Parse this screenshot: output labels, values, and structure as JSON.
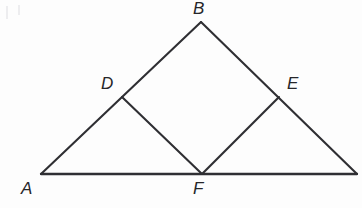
{
  "figure": {
    "background_color": "#fdfdfd",
    "stroke_color": "#2f2f33",
    "label_color": "#262629",
    "width": 362,
    "height": 208,
    "points": {
      "A": {
        "label": "A",
        "x": 41,
        "y": 174,
        "label_x": 21,
        "label_y": 180
      },
      "B": {
        "label": "B",
        "x": 201,
        "y": 22,
        "label_x": 193,
        "label_y": 0
      },
      "C": {
        "label": "",
        "x": 357,
        "y": 174,
        "label_x": 0,
        "label_y": 0
      },
      "D": {
        "label": "D",
        "x": 122,
        "y": 97,
        "label_x": 101,
        "label_y": 75
      },
      "E": {
        "label": "E",
        "x": 279,
        "y": 97,
        "label_x": 287,
        "label_y": 75
      },
      "F": {
        "label": "F",
        "x": 202,
        "y": 174,
        "label_x": 193,
        "label_y": 180
      }
    },
    "segments": [
      {
        "name": "segment-A-C",
        "from": "A",
        "to": "C",
        "style": "base"
      },
      {
        "name": "segment-A-B",
        "from": "A",
        "to": "B",
        "style": "edge"
      },
      {
        "name": "segment-B-C",
        "from": "B",
        "to": "C",
        "style": "edge"
      },
      {
        "name": "segment-D-F",
        "from": "D",
        "to": "F",
        "style": "edge"
      },
      {
        "name": "segment-F-E",
        "from": "F",
        "to": "E",
        "style": "edge"
      }
    ],
    "vertex_labels": [
      "A",
      "B",
      "D",
      "E",
      "F"
    ]
  }
}
